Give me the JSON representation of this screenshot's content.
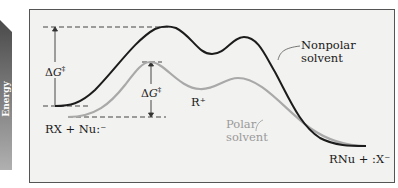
{
  "diagram": {
    "type": "reaction-energy-profile",
    "axis": {
      "label": "Energy",
      "arrow_gradient": [
        "#4a4a4a",
        "#a8a8a8"
      ]
    },
    "curves": [
      {
        "name": "Nonpolar solvent",
        "color": "#1c1c1c"
      },
      {
        "name": "Polar solvent",
        "color": "#a9a9a9"
      }
    ],
    "labels": {
      "reactants": "RX + Nu:⁻",
      "intermediate": "R⁺",
      "products": "RNu + :X⁻",
      "nonpolar_line1": "Nonpolar",
      "nonpolar_line2": "solvent",
      "polar_line1": "Polar",
      "polar_line2": "solvent",
      "delta_g_prefix": "Δ",
      "delta_g_var": "G",
      "delta_g_sup": "‡"
    },
    "colors": {
      "frame_bg": "#f2f2f0",
      "frame_border": "#555555",
      "dash": "#444444"
    }
  }
}
